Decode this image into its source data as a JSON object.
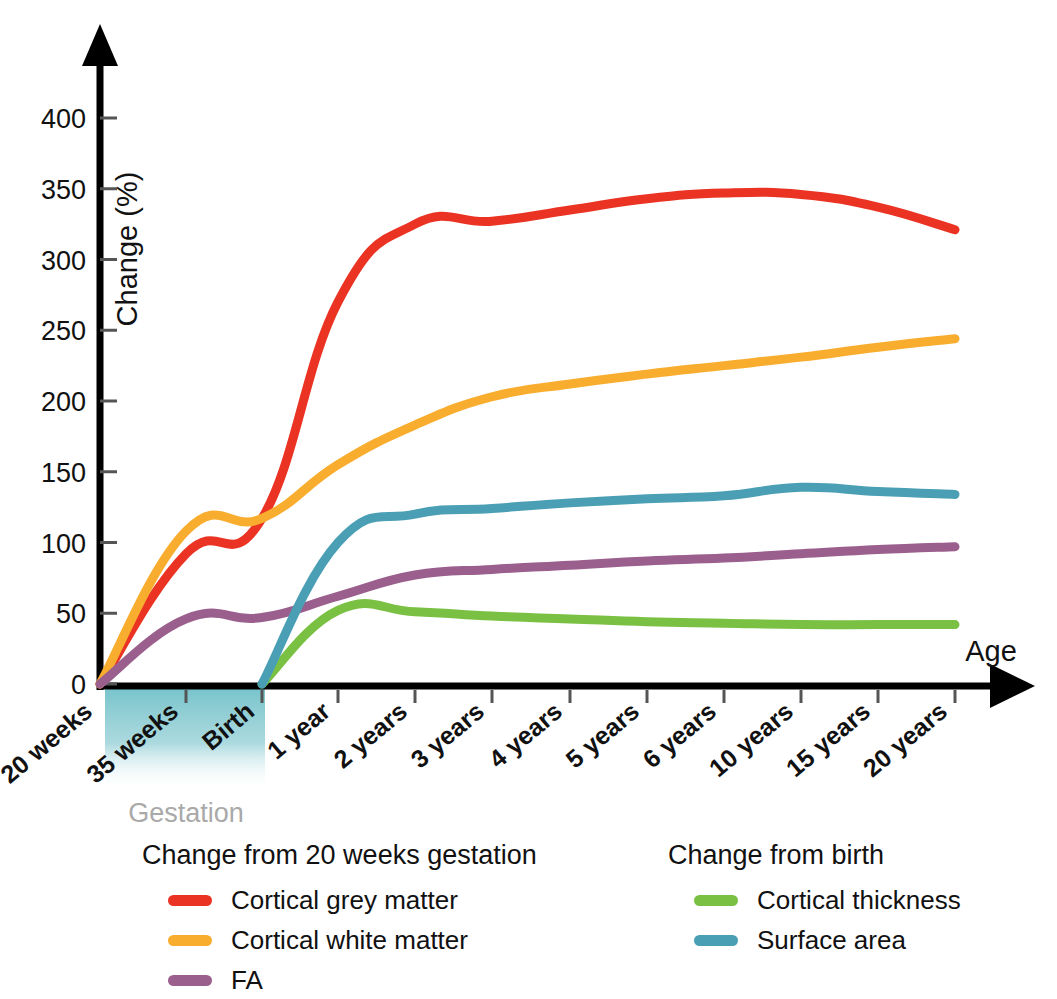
{
  "chart_data": {
    "type": "line",
    "title": "",
    "xlabel": "Age",
    "ylabel": "Change (%)",
    "ylim": [
      0,
      420
    ],
    "yticks": [
      0,
      50,
      100,
      150,
      200,
      250,
      300,
      350,
      400
    ],
    "grid": false,
    "legend_position": "bottom",
    "categories": [
      "20 weeks",
      "35 weeks",
      "Birth",
      "1 year",
      "2 years",
      "3 years",
      "4 years",
      "5 years",
      "6 years",
      "10 years",
      "15 years",
      "20 years"
    ],
    "annotations": [
      {
        "text": "Gestation",
        "span": [
          "20 weeks",
          "Birth"
        ],
        "color": "#a9a9a9"
      }
    ],
    "series": [
      {
        "name": "Cortical grey matter",
        "color": "#ea3323",
        "baseline": "20 weeks",
        "values": [
          0,
          92,
          117,
          270,
          325,
          327,
          335,
          343,
          347,
          346,
          337,
          321
        ]
      },
      {
        "name": "Cortical white matter",
        "color": "#f9ad2f",
        "baseline": "20 weeks",
        "values": [
          0,
          108,
          117,
          155,
          183,
          203,
          212,
          219,
          225,
          231,
          238,
          244
        ]
      },
      {
        "name": "FA",
        "color": "#9b5f8e",
        "baseline": "20 weeks",
        "values": [
          0,
          46,
          47,
          62,
          77,
          81,
          84,
          87,
          89,
          92,
          95,
          97
        ]
      },
      {
        "name": "Cortical thickness",
        "color": "#7ac143",
        "baseline": "Birth",
        "values": [
          null,
          null,
          0,
          52,
          51,
          48,
          46,
          44,
          43,
          42,
          42,
          42
        ]
      },
      {
        "name": "Surface area",
        "color": "#4a9fb5",
        "baseline": "Birth",
        "values": [
          null,
          null,
          0,
          100,
          120,
          124,
          128,
          131,
          133,
          139,
          136,
          134
        ]
      }
    ]
  },
  "axes": {
    "y_title": "Change (%)",
    "x_title": "Age",
    "y_ticks": [
      "0",
      "50",
      "100",
      "150",
      "200",
      "250",
      "300",
      "350",
      "400"
    ],
    "x_ticks": [
      "20 weeks",
      "35 weeks",
      "Birth",
      "1 year",
      "2 years",
      "3 years",
      "4 years",
      "5 years",
      "6 years",
      "10 years",
      "15 years",
      "20 years"
    ]
  },
  "gestation": {
    "label": "Gestation",
    "shade_color": "#6fc0c8"
  },
  "legend": {
    "groups": [
      {
        "title": "Change from 20 weeks gestation",
        "entries": [
          {
            "label": "Cortical grey matter",
            "color": "#ea3323"
          },
          {
            "label": "Cortical white matter",
            "color": "#f9ad2f"
          },
          {
            "label": "FA",
            "color": "#9b5f8e"
          }
        ]
      },
      {
        "title": "Change from birth",
        "entries": [
          {
            "label": "Cortical thickness",
            "color": "#7ac143"
          },
          {
            "label": "Surface area",
            "color": "#4a9fb5"
          }
        ]
      }
    ]
  }
}
